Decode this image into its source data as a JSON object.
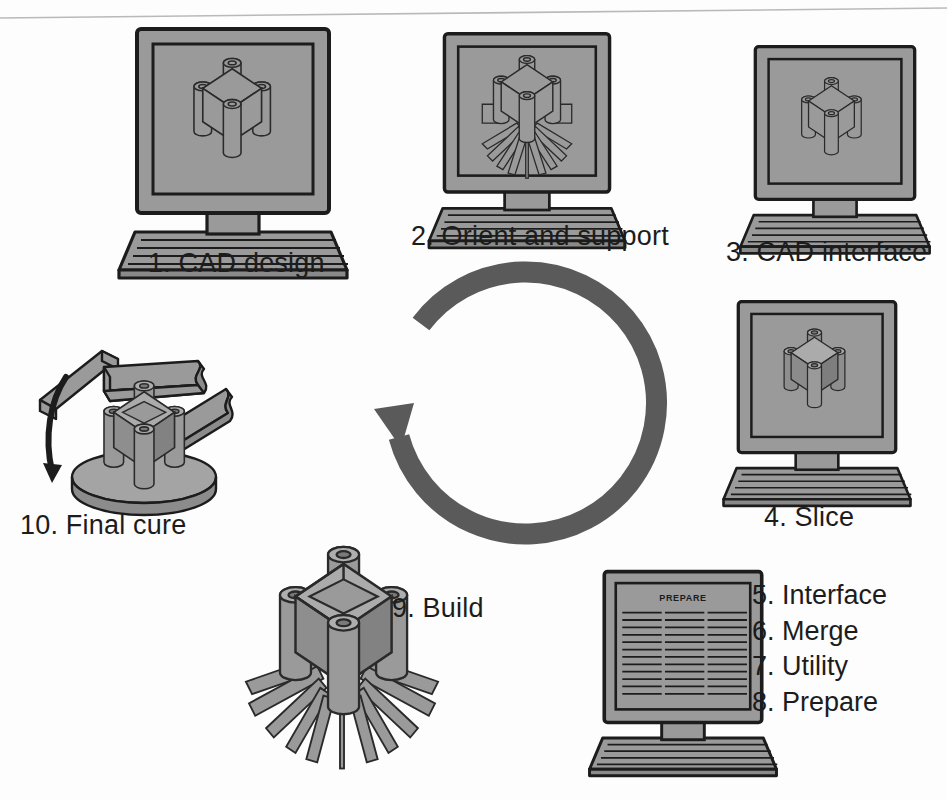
{
  "figure": {
    "background_color": "#fdfdfd",
    "ink_color": "#1c1c1c",
    "fill_gray": "#9a9a9a",
    "fill_gray_dark": "#7d7d7d",
    "fill_gray_light": "#b4b4b4",
    "arrow_color": "#5a5a5a"
  },
  "scan_line": {
    "name": "page-edge-scan-line",
    "color": "#b9b9b9"
  },
  "steps": [
    {
      "number": "1.",
      "label": "1. CAD design",
      "icon": "monitor-icon",
      "screen_content": "wireframe-part-with-supports"
    },
    {
      "number": "2.",
      "label": "2. Orient and support",
      "icon": "monitor-icon",
      "screen_content": "part-with-radial-supports"
    },
    {
      "number": "3.",
      "label": "3. CAD interface",
      "icon": "monitor-icon",
      "screen_content": "solid-part-wireframe"
    },
    {
      "number": "4.",
      "label": "4. Slice",
      "icon": "monitor-icon",
      "screen_content": "sliced-solid-part"
    },
    {
      "number": "9.",
      "label": "9. Build",
      "icon": "built-part-icon",
      "screen_content": "part-with-full-support-array"
    },
    {
      "number": "10.",
      "label": "10. Final cure",
      "icon": "post-cure-icon",
      "screen_content": "part-on-rotating-platform"
    }
  ],
  "software_steps": {
    "name": "software-step-list",
    "items": [
      "5. Interface",
      "6. Merge",
      "7. Utility",
      "8. Prepare"
    ]
  },
  "prepare_monitor": {
    "screen_title": "PREPARE",
    "text_columns": 3,
    "text_rows": 12
  },
  "cycle_arrow": {
    "name": "cycle-arrow",
    "direction": "counterclockwise",
    "head_angle_deg": 205,
    "tail_angle_deg": 140
  }
}
